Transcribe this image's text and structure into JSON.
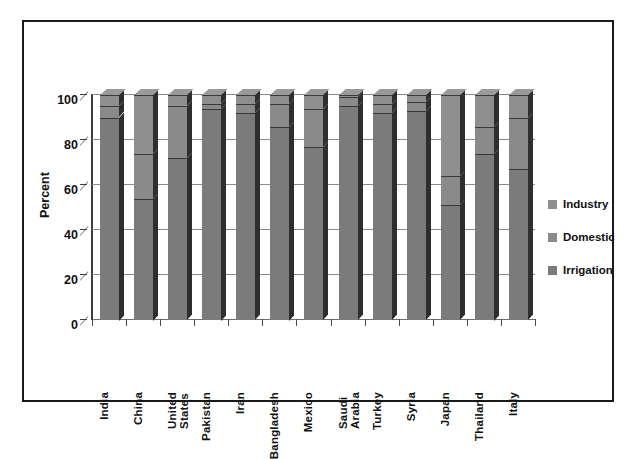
{
  "chart_data": {
    "type": "bar",
    "subtype": "stacked-column-3d",
    "title": "",
    "xlabel": "",
    "ylabel": "Percent",
    "ylim": [
      0,
      100
    ],
    "yticks": [
      0,
      20,
      40,
      60,
      80,
      100
    ],
    "grid": true,
    "legend_position": "right",
    "categories": [
      "India",
      "China",
      "United\nStates",
      "Pakistan",
      "Iran",
      "Bangladesh",
      "Mexico",
      "Saudi\nArabia",
      "Turkey",
      "Syria",
      "Japan",
      "Thailand",
      "Italy"
    ],
    "series": [
      {
        "name": "Irrigation",
        "color": "#7b7b7b",
        "values": [
          90,
          54,
          72,
          94,
          92,
          86,
          77,
          95,
          92,
          93,
          51,
          74,
          67
        ]
      },
      {
        "name": "Domestic",
        "color": "#8a8a8a",
        "values": [
          5,
          20,
          23,
          2,
          4,
          10,
          17,
          4,
          4,
          4,
          13,
          12,
          23
        ]
      },
      {
        "name": "Industry",
        "color": "#8f8f8f",
        "values": [
          5,
          26,
          5,
          4,
          4,
          4,
          6,
          1,
          4,
          3,
          36,
          14,
          10
        ]
      }
    ],
    "total": 100
  },
  "axis": {
    "y_title": "Percent",
    "y_tick_labels": [
      "100",
      "80",
      "60",
      "40",
      "20",
      "0"
    ]
  },
  "legend": {
    "items": [
      {
        "label": "Industry",
        "color": "#8f8f8f",
        "swatch": "legend-swatch-industry"
      },
      {
        "label": "Domestic",
        "color": "#8a8a8a",
        "swatch": "legend-swatch-domestic"
      },
      {
        "label": "Irrigation",
        "color": "#7b7b7b",
        "swatch": "legend-swatch-irrigation"
      }
    ]
  }
}
